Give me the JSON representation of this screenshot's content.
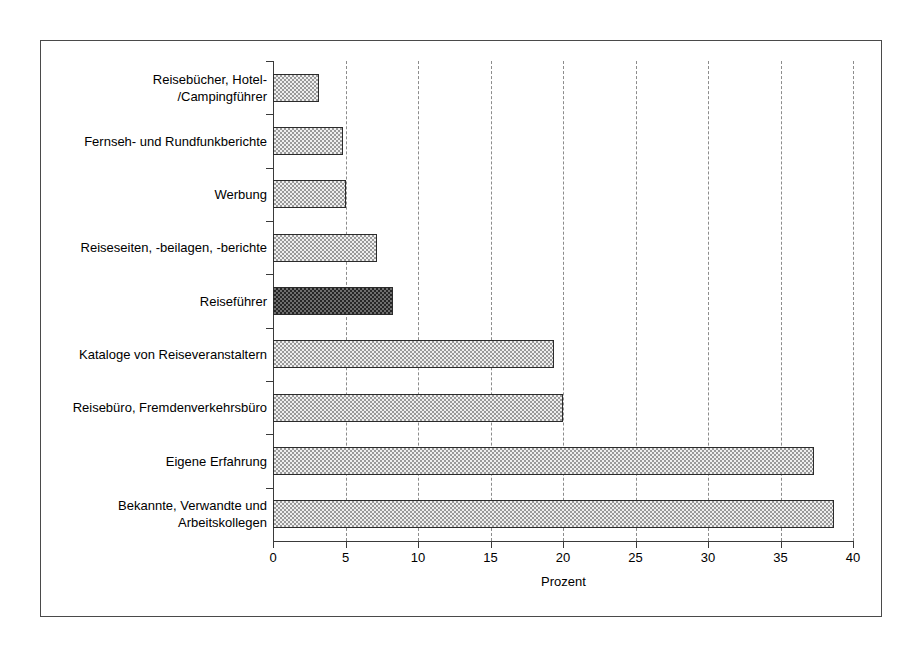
{
  "chart_data": {
    "type": "bar",
    "orientation": "horizontal",
    "title": "",
    "xlabel": "Prozent",
    "ylabel": "",
    "xlim": [
      0,
      40
    ],
    "xticks": [
      0,
      5,
      10,
      15,
      20,
      25,
      30,
      35,
      40
    ],
    "xtick_labels": [
      "0",
      "5",
      "10",
      "15",
      "20",
      "25",
      "30",
      "35",
      "40"
    ],
    "grid": "vertical-dashed",
    "legend": "none",
    "categories": [
      "Reisebücher, Hotel- /Campingführer",
      "Fernseh- und Rundfunkberichte",
      "Werbung",
      "Reiseseiten, -beilagen, -berichte",
      "Reiseführer",
      "Kataloge von Reiseveranstaltern",
      "Reisebüro, Fremdenverkehrsbüro",
      "Eigene Erfahrung",
      "Bekannte, Verwandte und Arbeitskollegen"
    ],
    "values": [
      3.2,
      4.8,
      5.0,
      7.2,
      8.3,
      19.4,
      20.0,
      37.3,
      38.7
    ],
    "highlighted_index": 4,
    "colors": {
      "bar_light_fill": "#efefef",
      "bar_light_hatch": "#9a9a9a",
      "bar_dark_fill": "#6e6e6e",
      "bar_dark_hatch": "#262626",
      "bar_outline": "#2b2b2b",
      "axis": "#3a3a3a",
      "gridline": "#8c8c8c",
      "frame": "#4a4a4a",
      "background": "#ffffff"
    },
    "bars": [
      {
        "label_lines": [
          "Reisebücher, Hotel-",
          "/Campingführer"
        ],
        "value": 3.2,
        "style": "light"
      },
      {
        "label_lines": [
          "Fernseh- und Rundfunkberichte"
        ],
        "value": 4.8,
        "style": "light"
      },
      {
        "label_lines": [
          "Werbung"
        ],
        "value": 5.0,
        "style": "light"
      },
      {
        "label_lines": [
          "Reiseseiten, -beilagen, -berichte"
        ],
        "value": 7.2,
        "style": "light"
      },
      {
        "label_lines": [
          "Reiseführer"
        ],
        "value": 8.3,
        "style": "dark"
      },
      {
        "label_lines": [
          "Kataloge von Reiseveranstaltern"
        ],
        "value": 19.4,
        "style": "light"
      },
      {
        "label_lines": [
          "Reisebüro, Fremdenverkehrsbüro"
        ],
        "value": 20.0,
        "style": "light"
      },
      {
        "label_lines": [
          "Eigene Erfahrung"
        ],
        "value": 37.3,
        "style": "light"
      },
      {
        "label_lines": [
          "Bekannte, Verwandte und",
          "Arbeitskollegen"
        ],
        "value": 38.7,
        "style": "light"
      }
    ]
  }
}
